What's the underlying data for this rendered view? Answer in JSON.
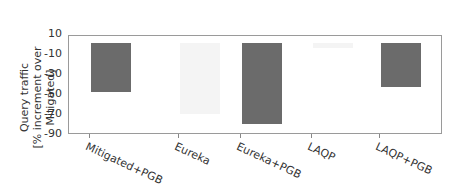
{
  "chart_data": {
    "type": "bar",
    "title": "",
    "xlabel": "",
    "ylabel": "Query traffic\n[% increment over Mitigated]",
    "ylabel_lines": [
      "Query traffic",
      "[% increment over Mitigated]"
    ],
    "ylim": [
      -90,
      10
    ],
    "yticks": [
      "10",
      "-10",
      "-30",
      "-50",
      "-70",
      "-90"
    ],
    "categories": [
      "Mitigated+PGB",
      "Eureka",
      "Eureka+PGB",
      "LAQP",
      "LAQP+PGB"
    ],
    "values": [
      -48,
      -70,
      -80,
      -3,
      -43
    ],
    "colors": [
      "#6b6b6b",
      "#f4f4f4",
      "#6b6b6b",
      "#f4f4f4",
      "#6b6b6b"
    ],
    "grid": false,
    "legend": null
  }
}
